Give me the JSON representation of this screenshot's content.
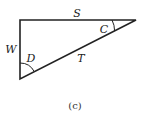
{
  "diagram": {
    "type": "right-triangle",
    "vertices": {
      "top_left": [
        20,
        20
      ],
      "top_right": [
        136,
        20
      ],
      "bottom_left": [
        20,
        79
      ]
    },
    "sides": {
      "top": "S",
      "left": "W",
      "hypotenuse": "T"
    },
    "angles": {
      "at_top_right": "C",
      "at_bottom_left": "D"
    },
    "caption": "(c)",
    "stroke_color": "#222222"
  }
}
